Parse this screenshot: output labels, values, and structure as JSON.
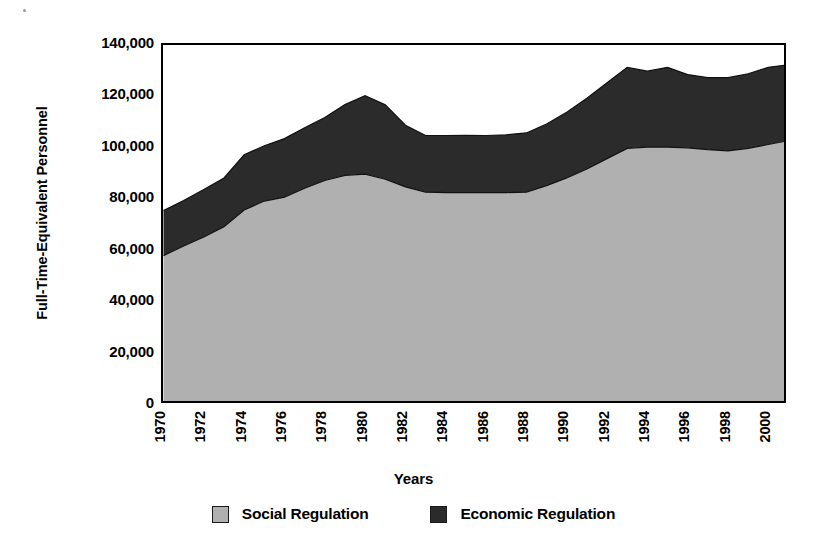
{
  "chart_data": {
    "type": "area",
    "stacked": true,
    "title": "",
    "xlabel": "Years",
    "ylabel": "Full-Time-Equivalent Personnel",
    "xlim": [
      1970,
      2001
    ],
    "ylim": [
      0,
      140000
    ],
    "ytick_labels": [
      "140,000",
      "120,000",
      "100,000",
      "80,000",
      "60,000",
      "40,000",
      "20,000",
      "0"
    ],
    "ytick_values": [
      140000,
      120000,
      100000,
      80000,
      60000,
      40000,
      20000,
      0
    ],
    "xtick_labels": [
      "1970",
      "1972",
      "1974",
      "1976",
      "1978",
      "1980",
      "1982",
      "1984",
      "1986",
      "1988",
      "1990",
      "1992",
      "1994",
      "1996",
      "1998",
      "2000"
    ],
    "xtick_values": [
      1970,
      1972,
      1974,
      1976,
      1978,
      1980,
      1982,
      1984,
      1986,
      1988,
      1990,
      1992,
      1994,
      1996,
      1998,
      2000
    ],
    "grid": false,
    "legend_position": "bottom",
    "x": [
      1970,
      1971,
      1972,
      1973,
      1974,
      1975,
      1976,
      1977,
      1978,
      1979,
      1980,
      1981,
      1982,
      1983,
      1984,
      1985,
      1986,
      1987,
      1988,
      1989,
      1990,
      1991,
      1992,
      1993,
      1994,
      1995,
      1996,
      1997,
      1998,
      1999,
      2000,
      2001
    ],
    "series": [
      {
        "name": "Social Regulation",
        "color": "#b0b0b0",
        "values": [
          58300,
          62000,
          65500,
          69500,
          76000,
          79500,
          81000,
          84500,
          87500,
          89500,
          90000,
          88000,
          85000,
          83000,
          82800,
          82800,
          82800,
          82800,
          83000,
          85500,
          88500,
          92000,
          96000,
          100000,
          100500,
          100500,
          100200,
          99500,
          99000,
          100000,
          101500,
          103000
        ]
      },
      {
        "name": "Economic Regulation",
        "color": "#2b2b2b",
        "values": [
          17500,
          17700,
          18500,
          19000,
          21500,
          21500,
          22800,
          23500,
          24500,
          27500,
          30500,
          29000,
          24000,
          22000,
          22200,
          22300,
          22200,
          22500,
          23000,
          24000,
          25500,
          27500,
          29500,
          31500,
          29500,
          31000,
          28500,
          28000,
          28500,
          29000,
          30000,
          29500
        ]
      }
    ],
    "totals": [
      75800,
      79700,
      84000,
      88500,
      97500,
      101000,
      103800,
      108000,
      112000,
      117000,
      120500,
      117000,
      109000,
      105000,
      105000,
      105100,
      105000,
      105300,
      106000,
      109500,
      114000,
      119500,
      125500,
      131500,
      130000,
      131500,
      128700,
      127500,
      127500,
      129000,
      131500,
      132500
    ]
  },
  "legend": {
    "items": [
      {
        "label": "Social Regulation",
        "swatch_name": "legend-swatch-social"
      },
      {
        "label": "Economic Regulation",
        "swatch_name": "legend-swatch-economic"
      }
    ]
  },
  "axes": {
    "y_title": "Full-Time-Equivalent Personnel",
    "x_title": "Years"
  }
}
